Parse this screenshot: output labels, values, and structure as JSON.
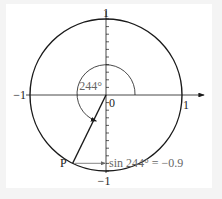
{
  "diagram": {
    "type": "unit-circle",
    "angle_degrees": 244,
    "point_label": "P",
    "labels": {
      "top": "1",
      "bottom": "−1",
      "left": "−1",
      "right": "1",
      "origin": "0",
      "angle": "244°",
      "equation": "sin 244° = −0.9"
    },
    "sin_value": -0.9,
    "colors": {
      "stroke": "#1a1a1a",
      "annotation": "#666666",
      "background": "#ffffff"
    }
  }
}
